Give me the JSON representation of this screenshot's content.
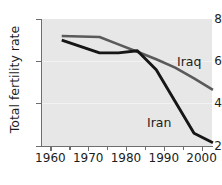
{
  "chart_data": {
    "type": "line",
    "title": "",
    "subtitle": "",
    "xlabel": "",
    "ylabel": "Total fertility rate",
    "xlim": [
      1960,
      2005
    ],
    "ylim": [
      2,
      8
    ],
    "grid": true,
    "legend_position": "inline-annotation",
    "x_ticks_major": [
      1960,
      1970,
      1980,
      1990,
      2000
    ],
    "x_ticks_minor": [
      1965,
      1975,
      1985,
      1995,
      2005
    ],
    "x_tick_labels": [
      "1960",
      "1970",
      "1980",
      "1990",
      "2000"
    ],
    "y_ticks": [
      2,
      4,
      6,
      8
    ],
    "y_tick_labels": [
      "2",
      "4",
      "6",
      "8"
    ],
    "series": [
      {
        "name": "Iraq",
        "color": "#5a5a5a",
        "x": [
          1963,
          1973,
          1978,
          1983,
          1988,
          1993,
          1998,
          2003
        ],
        "values": [
          7.2,
          7.15,
          6.8,
          6.45,
          6.1,
          5.7,
          5.2,
          4.65
        ]
      },
      {
        "name": "Iran",
        "color": "#161616",
        "x": [
          1963,
          1973,
          1978,
          1983,
          1988,
          1993,
          1998,
          2003
        ],
        "values": [
          7.0,
          6.4,
          6.4,
          6.5,
          5.6,
          4.1,
          2.6,
          2.15
        ]
      }
    ],
    "annotations": [
      {
        "text": "Iraq",
        "series": "Iraq",
        "x": 1998,
        "y": 6.2
      },
      {
        "text": "Iran",
        "series": "Iran",
        "x": 1991,
        "y": 3.3
      }
    ]
  },
  "colors": {
    "plot_background": "#e7e7e7",
    "page_background": "#ffffff",
    "axis": "#6e6e6e",
    "gridline": "#f2f2f2",
    "text": "#1c1c1c",
    "iraq": "#5a5a5a",
    "iran": "#161616"
  }
}
